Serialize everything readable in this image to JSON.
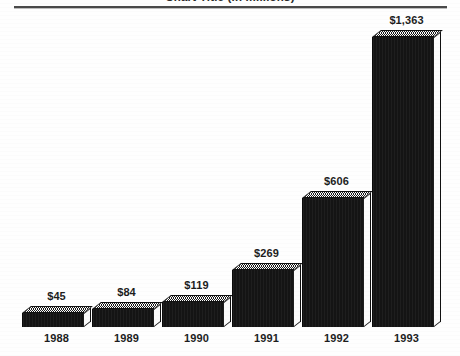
{
  "chart_data": {
    "type": "bar",
    "title": "Chart Title (in millions)",
    "subtitle": "",
    "xlabel": "",
    "ylabel": "",
    "categories": [
      "1988",
      "1989",
      "1990",
      "1991",
      "1992",
      "1993"
    ],
    "values": [
      45,
      84,
      119,
      269,
      606,
      1363
    ],
    "value_labels": [
      "$45",
      "$84",
      "$119",
      "$269",
      "$606",
      "$1,363"
    ],
    "ylim": [
      0,
      1363
    ],
    "grid": false,
    "legend": null,
    "legend_position": "none",
    "style": "3d-extruded-bars",
    "bar_fill_color": "#141414",
    "bar_top_color": "#d9d9d9",
    "bar_side_color": "#fbfbfb",
    "axis_color": "#4a4a4a",
    "text_color": "#1d1d1d",
    "background_color": "#ffffff"
  },
  "header": {
    "title": "Chart Title (in millions)",
    "rule_visible": true
  },
  "axes": {
    "baseline_visible": false,
    "top_rule_visible": true,
    "y_axis_labels_visible": false
  }
}
